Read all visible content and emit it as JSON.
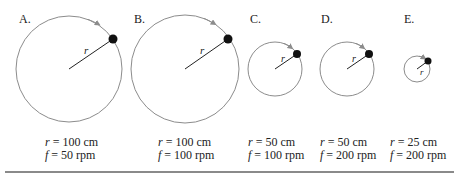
{
  "diagram": {
    "panels": [
      {
        "id": "A",
        "label": "A.",
        "r_text": "r = 100 cm",
        "f_text": "f = 50 rpm",
        "r_var": "r",
        "r_val": "= 100 cm",
        "f_var": "f",
        "f_val": "= 50 rpm",
        "radius_label": "r"
      },
      {
        "id": "B",
        "label": "B.",
        "r_text": "r = 100 cm",
        "f_text": "f = 100 rpm",
        "r_var": "r",
        "r_val": "= 100 cm",
        "f_var": "f",
        "f_val": "= 100 rpm",
        "radius_label": "r"
      },
      {
        "id": "C",
        "label": "C.",
        "r_text": "r = 50 cm",
        "f_text": "f = 100 rpm",
        "r_var": "r",
        "r_val": "= 50 cm",
        "f_var": "f",
        "f_val": "= 100 rpm",
        "radius_label": "r"
      },
      {
        "id": "D",
        "label": "D.",
        "r_text": "r = 50 cm",
        "f_text": "f = 200 rpm",
        "r_var": "r",
        "r_val": "= 50 cm",
        "f_var": "f",
        "f_val": "= 200 rpm",
        "radius_label": "r"
      },
      {
        "id": "E",
        "label": "E.",
        "r_text": "r = 25 cm",
        "f_text": "f = 200 rpm",
        "r_var": "r",
        "r_val": "= 25 cm",
        "f_var": "f",
        "f_val": "= 200 rpm",
        "radius_label": "r"
      }
    ],
    "colors": {
      "circle": "#8c8c8c",
      "radius_line": "#222222",
      "ball": "#111111",
      "divider": "#8a8a8a"
    }
  }
}
